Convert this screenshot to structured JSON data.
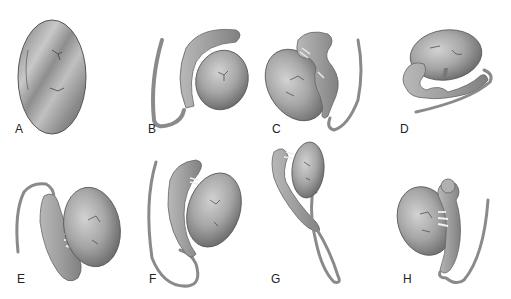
{
  "figure": {
    "panels": [
      {
        "label": "A",
        "content": "testis alone (oval)",
        "label_x": 15,
        "label_y": 123
      },
      {
        "label": "B",
        "content": "testis with epididymis arching over, vas deferens descending left",
        "label_x": 148,
        "label_y": 123
      },
      {
        "label": "C",
        "content": "testis with detached looping epididymis, vas deferens on right",
        "label_x": 272,
        "label_y": 123
      },
      {
        "label": "D",
        "content": "horizontal testis with epididymis below, vas deferens extending left",
        "label_x": 400,
        "label_y": 123
      },
      {
        "label": "E",
        "content": "testis with epididymis on left connected by efferent ducts",
        "label_x": 17,
        "label_y": 273
      },
      {
        "label": "F",
        "content": "testis with long epididymis and vas deferens looping",
        "label_x": 149,
        "label_y": 273
      },
      {
        "label": "G",
        "content": "small testis with elongated epididymis and long vas loop",
        "label_x": 271,
        "label_y": 273
      },
      {
        "label": "H",
        "content": "testis on left, epididymis on right with bulbous head",
        "label_x": 403,
        "label_y": 273
      }
    ],
    "colors": {
      "background": "#ffffff",
      "organ_fill_light": "#c4c4c4",
      "organ_fill_mid": "#9a9a9a",
      "organ_fill_dark": "#6e6e6e",
      "outline": "#5a5a5a",
      "duct": "#8c8c8c",
      "label": "#222222"
    }
  }
}
